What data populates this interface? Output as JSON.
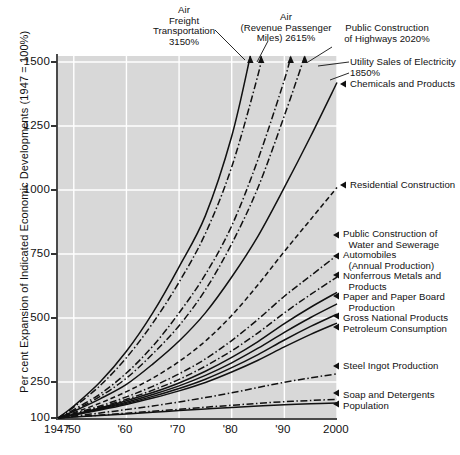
{
  "chart_data": {
    "type": "line",
    "title": "",
    "xlabel": "",
    "ylabel": "Per cent Expansion of Indicated Economic Developments (1947 = 100%)",
    "xlim": [
      1947,
      2000
    ],
    "ylim": [
      100,
      1500
    ],
    "ytick_labels": [
      "1500",
      "1250",
      "1000",
      "750",
      "500",
      "250",
      "100"
    ],
    "ytick_values": [
      1500,
      1250,
      1000,
      750,
      500,
      250,
      100
    ],
    "xtick_labels": [
      "1947",
      "'50",
      "'60",
      "'70",
      "'80",
      "'90",
      "2000"
    ],
    "xtick_values": [
      1947,
      1950,
      1960,
      1970,
      1980,
      1990,
      2000
    ],
    "grid": true,
    "legend": "none (direct end-of-line labels with arrow pointers)",
    "plot_background": "#d8d8d8",
    "gridline_color": "#ffffff",
    "line_color": "#111111",
    "x": [
      1947,
      1950,
      1955,
      1960,
      1965,
      1970,
      1975,
      1980,
      1985,
      1990,
      1995,
      2000
    ],
    "series": [
      {
        "name": "Air Freight Transportation",
        "end_value_label": "3150%",
        "end_value": 3150,
        "style": "solid",
        "values": [
          100,
          150,
          250,
          370,
          520,
          700,
          900,
          1210,
          1620,
          2130,
          2620,
          3150
        ]
      },
      {
        "name": "Air (Revenue Passenger Miles)",
        "end_value_label": "2615%",
        "end_value": 2615,
        "style": "dashdot",
        "values": [
          100,
          145,
          235,
          345,
          480,
          640,
          830,
          1090,
          1450,
          1870,
          2240,
          2615
        ]
      },
      {
        "name": "Public Construction of Highways",
        "end_value_label": "2020%",
        "end_value": 2020,
        "style": "dashdot",
        "values": [
          100,
          135,
          200,
          285,
          390,
          520,
          670,
          860,
          1120,
          1430,
          1720,
          2020
        ]
      },
      {
        "name": "Utility Sales of Electricity",
        "end_value_label": "1850%",
        "end_value": 1850,
        "style": "dashdot",
        "values": [
          100,
          130,
          190,
          265,
          360,
          470,
          610,
          790,
          1010,
          1290,
          1560,
          1850
        ]
      },
      {
        "name": "Chemicals and Products",
        "end_value_label": "",
        "end_value": 1420,
        "style": "solid",
        "values": [
          100,
          128,
          180,
          240,
          320,
          410,
          520,
          660,
          820,
          1010,
          1210,
          1420
        ]
      },
      {
        "name": "Residential Construction",
        "end_value_label": "",
        "end_value": 1010,
        "style": "dashed",
        "values": [
          100,
          122,
          162,
          210,
          265,
          330,
          410,
          510,
          630,
          760,
          885,
          1010
        ]
      },
      {
        "name": "Public Construction of Water and Sewerage",
        "end_value_label": "",
        "end_value": 745,
        "style": "dashdot",
        "values": [
          100,
          118,
          150,
          188,
          232,
          282,
          340,
          412,
          495,
          585,
          665,
          745
        ]
      },
      {
        "name": "Automobiles (Annual Production)",
        "end_value_label": "",
        "end_value": 660,
        "style": "dashdot",
        "values": [
          100,
          116,
          145,
          178,
          216,
          260,
          312,
          372,
          442,
          520,
          592,
          660
        ]
      },
      {
        "name": "Nonferrous Metals and Products",
        "end_value_label": "",
        "end_value": 600,
        "style": "solid",
        "values": [
          100,
          115,
          142,
          172,
          206,
          246,
          292,
          346,
          408,
          478,
          542,
          600
        ]
      },
      {
        "name": "Paper and Paper Board Production",
        "end_value_label": "",
        "end_value": 555,
        "style": "solid",
        "values": [
          100,
          114,
          139,
          166,
          198,
          234,
          276,
          325,
          382,
          444,
          502,
          555
        ]
      },
      {
        "name": "Gross National Products",
        "end_value_label": "",
        "end_value": 515,
        "style": "solid",
        "values": [
          100,
          113,
          136,
          161,
          190,
          223,
          261,
          306,
          357,
          414,
          467,
          515
        ]
      },
      {
        "name": "Petroleum Consumption",
        "end_value_label": "",
        "end_value": 480,
        "style": "solid",
        "values": [
          100,
          112,
          133,
          156,
          183,
          213,
          248,
          289,
          335,
          387,
          436,
          480
        ]
      },
      {
        "name": "Steel Ingot Production",
        "end_value_label": "",
        "end_value": 282,
        "style": "dashdot",
        "values": [
          100,
          108,
          121,
          135,
          150,
          167,
          185,
          205,
          227,
          249,
          266,
          282
        ]
      },
      {
        "name": "Soap and Detergents",
        "end_value_label": "",
        "end_value": 178,
        "style": "dashdot",
        "values": [
          100,
          105,
          112,
          120,
          128,
          136,
          145,
          153,
          161,
          168,
          173,
          178
        ]
      },
      {
        "name": "Population",
        "end_value_label": "",
        "end_value": 163,
        "style": "solid",
        "values": [
          100,
          104,
          110,
          117,
          124,
          131,
          138,
          144,
          150,
          155,
          159,
          163
        ]
      }
    ]
  },
  "top_labels": [
    {
      "id": "air-freight",
      "lines": [
        "Air",
        "Freight",
        "Transportation",
        "3150%"
      ]
    },
    {
      "id": "air-passenger",
      "lines": [
        "Air",
        "(Revenue Passenger",
        "Miles) 2615%"
      ]
    },
    {
      "id": "highways",
      "lines": [
        "Public Construction",
        "of Highways 2020%"
      ]
    }
  ],
  "right_labels": [
    {
      "id": "utility-electricity",
      "lines": [
        "Utility Sales of Electricity",
        "1850%"
      ],
      "arrow": false
    },
    {
      "id": "chemicals",
      "lines": [
        "Chemicals and Products"
      ],
      "arrow": true
    },
    {
      "id": "residential",
      "lines": [
        "Residential Construction"
      ],
      "arrow": true
    },
    {
      "id": "water-sewerage",
      "lines": [
        "Public Construction of",
        "  Water and Sewerage"
      ],
      "arrow": true
    },
    {
      "id": "automobiles",
      "lines": [
        "Automobiles",
        "  (Annual Production)"
      ],
      "arrow": true
    },
    {
      "id": "nonferrous",
      "lines": [
        "Nonferrous Metals and",
        "  Products"
      ],
      "arrow": true
    },
    {
      "id": "paper",
      "lines": [
        "Paper and Paper Board",
        "  Production"
      ],
      "arrow": true
    },
    {
      "id": "gnp",
      "lines": [
        "Gross National Products"
      ],
      "arrow": true
    },
    {
      "id": "petroleum",
      "lines": [
        "Petroleum Consumption"
      ],
      "arrow": true
    },
    {
      "id": "steel",
      "lines": [
        "Steel Ingot Production"
      ],
      "arrow": true
    },
    {
      "id": "soap",
      "lines": [
        "Soap and Detergents"
      ],
      "arrow": true
    },
    {
      "id": "population",
      "lines": [
        "Population"
      ],
      "arrow": true
    }
  ],
  "axis": {
    "y_title": "Per cent Expansion of Indicated Economic Developments (1947 = 100%)",
    "y_ticks": [
      "1500",
      "1250",
      "1000",
      "750",
      "500",
      "250",
      "100"
    ],
    "x_ticks": [
      "1947",
      "'50",
      "'60",
      "'70",
      "'80",
      "'90",
      "2000"
    ]
  }
}
